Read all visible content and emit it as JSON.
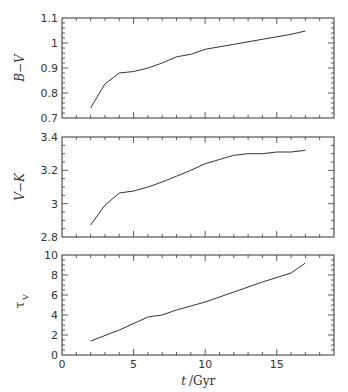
{
  "chart_data": [
    {
      "type": "line",
      "title": "",
      "xlabel": "t / Gyr",
      "ylabel": "B−V",
      "xlim": [
        0,
        19
      ],
      "ylim": [
        0.7,
        1.1
      ],
      "xticks": [
        "0",
        "5",
        "10",
        "15"
      ],
      "yticks": [
        "0.7",
        "0.8",
        "0.9",
        "1",
        "1.1"
      ],
      "x": [
        2,
        3,
        4,
        5,
        6,
        7,
        8,
        9,
        10,
        12,
        14,
        16,
        17
      ],
      "values": [
        0.74,
        0.836,
        0.88,
        0.886,
        0.9,
        0.92,
        0.945,
        0.955,
        0.975,
        0.995,
        1.015,
        1.035,
        1.048
      ]
    },
    {
      "type": "line",
      "title": "",
      "xlabel": "t / Gyr",
      "ylabel": "V−K",
      "xlim": [
        0,
        19
      ],
      "ylim": [
        2.8,
        3.4
      ],
      "xticks": [
        "0",
        "5",
        "10",
        "15"
      ],
      "yticks": [
        "2.8",
        "3",
        "3.2",
        "3.4"
      ],
      "x": [
        2,
        3,
        4,
        5,
        6,
        7,
        8,
        9,
        10,
        11,
        12,
        13,
        14,
        15,
        16,
        17
      ],
      "values": [
        2.872,
        2.99,
        3.064,
        3.076,
        3.1,
        3.13,
        3.165,
        3.2,
        3.24,
        3.265,
        3.29,
        3.3,
        3.3,
        3.31,
        3.31,
        3.32
      ]
    },
    {
      "type": "line",
      "title": "",
      "xlabel": "t / Gyr",
      "ylabel": "τ_V",
      "xlim": [
        0,
        19
      ],
      "ylim": [
        0,
        10
      ],
      "xticks": [
        "0",
        "5",
        "10",
        "15"
      ],
      "yticks": [
        "0",
        "2",
        "4",
        "6",
        "8",
        "10"
      ],
      "x": [
        2,
        4,
        6,
        7,
        8,
        10,
        12,
        14,
        16,
        17
      ],
      "values": [
        1.4,
        2.5,
        3.8,
        4.0,
        4.5,
        5.3,
        6.3,
        7.3,
        8.2,
        9.2
      ]
    }
  ],
  "labels": {
    "panel1_ylabel": "B−V",
    "panel2_ylabel": "V−K",
    "panel3_ylabel": "τ",
    "panel3_ylabel_sub": "V",
    "xlabel_t": "t",
    "xlabel_unit": "/Gyr"
  }
}
